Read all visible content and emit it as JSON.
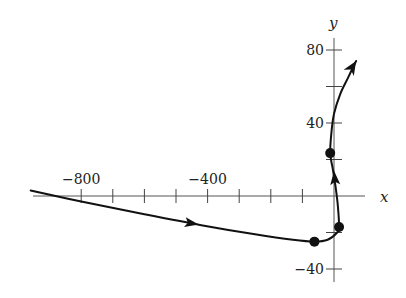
{
  "chart_data": {
    "type": "line",
    "title": "",
    "xlabel": "x",
    "ylabel": "y",
    "xlim": [
      -980,
      140
    ],
    "ylim": [
      -46,
      95
    ],
    "grid": false,
    "legend": null,
    "x_ticks": [
      -800,
      -700,
      -600,
      -500,
      -400,
      -300,
      -200,
      -100
    ],
    "x_tick_labels": [
      {
        "value": -800,
        "label": "−800"
      },
      {
        "value": -400,
        "label": "−400"
      }
    ],
    "y_ticks": [
      -40,
      -20,
      20,
      40,
      60,
      80
    ],
    "y_tick_labels": [
      {
        "value": 80,
        "label": "80"
      },
      {
        "value": 40,
        "label": "40"
      },
      {
        "value": -40,
        "label": "−40"
      }
    ],
    "series": [
      {
        "name": "trajectory",
        "x": [
          -960,
          -800,
          -600,
          -420,
          -250,
          -130,
          -62,
          -20,
          10,
          16,
          12,
          5,
          -4,
          -12,
          -8,
          0,
          20,
          45,
          70
        ],
        "y": [
          3,
          -3,
          -10,
          -16,
          -21,
          -24,
          -25,
          -24,
          -20,
          -17,
          -5,
          5,
          15,
          23.5,
          35,
          45,
          56,
          65,
          74
        ]
      }
    ],
    "marked_points": [
      {
        "x": -62,
        "y": -25
      },
      {
        "x": 16,
        "y": -17
      },
      {
        "x": -12,
        "y": 23.5
      }
    ],
    "direction_arrows": [
      {
        "at": [
          -450,
          -15
        ],
        "direction": "right"
      },
      {
        "at": [
          2,
          10
        ],
        "direction": "up"
      },
      {
        "at": [
          70,
          74
        ],
        "direction": "up-right",
        "endpoint": true
      }
    ]
  }
}
